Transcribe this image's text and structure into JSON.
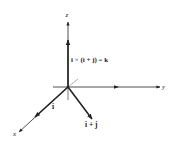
{
  "diagram": {
    "colors": {
      "background": "#ffffff",
      "stroke": "#222222"
    },
    "axes": {
      "x": {
        "label": "x"
      },
      "y": {
        "label": "y"
      },
      "z": {
        "label": "z"
      }
    },
    "vectors": [
      {
        "name": "i",
        "label": "i"
      },
      {
        "name": "i_plus_j",
        "label": "i + j"
      },
      {
        "name": "k",
        "label": "i × (i + j) = k"
      }
    ],
    "equation": {
      "left": "i",
      "op": "×",
      "right": "(i + j)",
      "eq": "=",
      "result": "k"
    }
  }
}
